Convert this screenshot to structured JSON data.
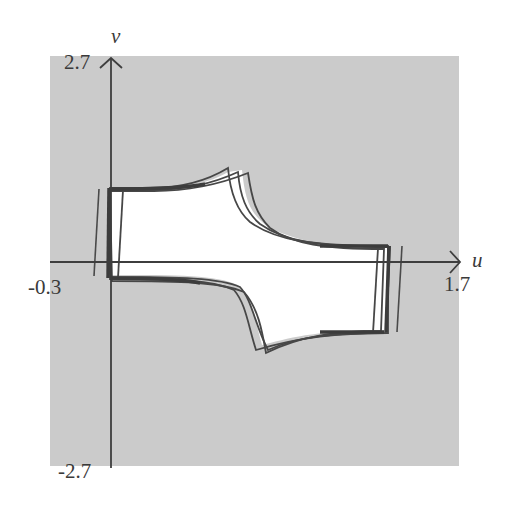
{
  "figure": {
    "axes": {
      "u": {
        "name": "u",
        "min_label": "-0.3",
        "max_label": "1.7",
        "min": -0.3,
        "max": 1.7
      },
      "v": {
        "name": "v",
        "min_label": "-2.7",
        "max_label": "2.7",
        "min": -2.7,
        "max": 2.7
      }
    },
    "colors": {
      "background": "#cbcbcb",
      "region_fill": "#ffffff",
      "stroke": "#474747",
      "axis": "#3e3e3e",
      "label": "#3a3a3a"
    }
  }
}
